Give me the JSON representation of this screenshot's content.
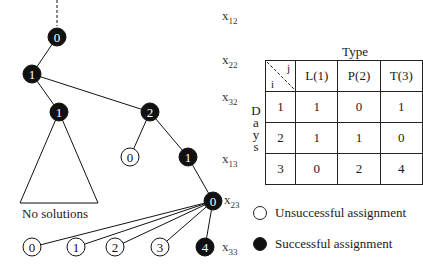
{
  "tree": {
    "levels": [
      {
        "var": "x",
        "sub": "12"
      },
      {
        "var": "x",
        "sub": "22"
      },
      {
        "var": "x",
        "sub": "32"
      },
      {
        "var": "x",
        "sub": "13"
      },
      {
        "var": "x",
        "sub": "23"
      },
      {
        "var": "x",
        "sub": "33"
      }
    ],
    "nodes": [
      {
        "id": "n0",
        "label": "0",
        "x": 57,
        "y": 37,
        "type": "successful"
      },
      {
        "id": "n1",
        "label": "1",
        "x": 32,
        "y": 74,
        "type": "successful"
      },
      {
        "id": "n2",
        "label": "1",
        "x": 59,
        "y": 112,
        "type": "successful"
      },
      {
        "id": "n3",
        "label": "2",
        "x": 150,
        "y": 112,
        "type": "successful"
      },
      {
        "id": "n4",
        "label": "0",
        "x": 130,
        "y": 157,
        "type": "unsuccessful"
      },
      {
        "id": "n5",
        "label": "1",
        "x": 188,
        "y": 157,
        "type": "successful"
      },
      {
        "id": "n6",
        "label": "0",
        "x": 213,
        "y": 201,
        "type": "successful"
      },
      {
        "id": "n7",
        "label": "0",
        "x": 32,
        "y": 247,
        "type": "unsuccessful"
      },
      {
        "id": "n8",
        "label": "1",
        "x": 76,
        "y": 247,
        "type": "unsuccessful"
      },
      {
        "id": "n9",
        "label": "2",
        "x": 115,
        "y": 247,
        "type": "unsuccessful"
      },
      {
        "id": "n10",
        "label": "3",
        "x": 160,
        "y": 247,
        "type": "unsuccessful"
      },
      {
        "id": "n11",
        "label": "4",
        "x": 205,
        "y": 247,
        "type": "successful"
      }
    ],
    "edges": [
      [
        "n0",
        "n1"
      ],
      [
        "n1",
        "n2"
      ],
      [
        "n1",
        "n3"
      ],
      [
        "n3",
        "n4"
      ],
      [
        "n3",
        "n5"
      ],
      [
        "n5",
        "n6"
      ],
      [
        "n6",
        "n7"
      ],
      [
        "n6",
        "n8"
      ],
      [
        "n6",
        "n9"
      ],
      [
        "n6",
        "n10"
      ],
      [
        "n6",
        "n11"
      ]
    ],
    "pruned_subtree_label": "No solutions"
  },
  "table": {
    "title": "Type",
    "corner": {
      "row_label": "i",
      "col_label": "j"
    },
    "columns": [
      "L(1)",
      "P(2)",
      "T(3)"
    ],
    "row_axis_label": "Days",
    "rows": [
      {
        "day": "1",
        "values": [
          "1",
          "0",
          "1"
        ]
      },
      {
        "day": "2",
        "values": [
          "1",
          "1",
          "0"
        ]
      },
      {
        "day": "3",
        "values": [
          "0",
          "2",
          "4"
        ]
      }
    ]
  },
  "legend": {
    "unsuccessful": "Unsuccessful assignment",
    "successful": "Successful assignment"
  }
}
